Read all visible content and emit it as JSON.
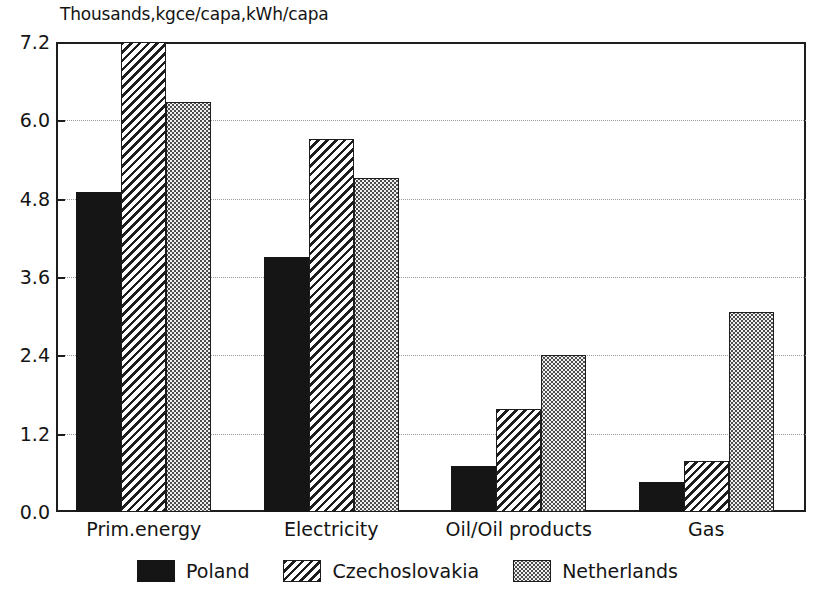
{
  "chart_data": {
    "type": "bar",
    "title": "Thousands,kgce/capa,kWh/capa",
    "subtitle": "",
    "xlabel": "",
    "ylabel": "",
    "ylim": [
      0.0,
      7.2
    ],
    "grid": true,
    "legend_position": "bottom",
    "categories": [
      "Prim.energy",
      "Electricity",
      "Oil/Oil products",
      "Gas"
    ],
    "ytick_labels": [
      "0.0",
      "1.2",
      "2.4",
      "3.6",
      "4.8",
      "6.0",
      "7.2"
    ],
    "ytick_values": [
      0.0,
      1.2,
      2.4,
      3.6,
      4.8,
      6.0,
      7.2
    ],
    "series": [
      {
        "name": "Poland",
        "pattern": "solid-black",
        "color": "#151515",
        "values": [
          4.9,
          3.9,
          0.7,
          0.46
        ]
      },
      {
        "name": "Czechoslovakia",
        "pattern": "diagonal-hatch",
        "color": "#1d1d1d",
        "values": [
          7.25,
          5.72,
          1.58,
          0.78
        ]
      },
      {
        "name": "Netherlands",
        "pattern": "dotted-stipple",
        "color": "#4d4d4d",
        "values": [
          6.28,
          5.11,
          2.4,
          3.06
        ]
      }
    ]
  }
}
